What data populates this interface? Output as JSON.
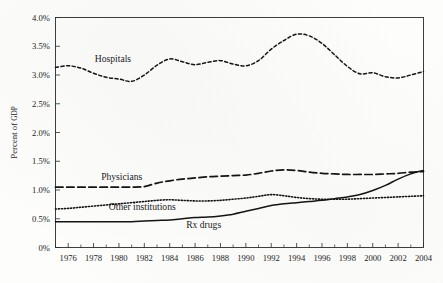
{
  "chart_data": {
    "type": "line",
    "title": "",
    "xlabel": "",
    "ylabel": "Percent of GDP",
    "ylabel_main": "Percent of ",
    "ylabel_smallcaps": "GDP",
    "xlim": [
      1975,
      2004
    ],
    "ylim": [
      0,
      4.0
    ],
    "grid": false,
    "legend_position": "inline-labels",
    "y_ticks": [
      0,
      0.5,
      1.0,
      1.5,
      2.0,
      2.5,
      3.0,
      3.5,
      4.0
    ],
    "y_tick_labels": [
      "0%",
      "0.5%",
      "1.0%",
      "1.5%",
      "2.0%",
      "2.5%",
      "3.0%",
      "3.5%",
      "4.0%"
    ],
    "x_ticks": [
      1976,
      1978,
      1980,
      1982,
      1984,
      1986,
      1988,
      1990,
      1992,
      1994,
      1996,
      1998,
      2000,
      2002,
      2004
    ],
    "x_tick_labels": [
      "1976",
      "1978",
      "1980",
      "1982",
      "1984",
      "1986",
      "1988",
      "1990",
      "1992",
      "1994",
      "1996",
      "1998",
      "2000",
      "2002",
      "2004"
    ],
    "x_minor_ticks_every": 1,
    "x": [
      1975,
      1976,
      1977,
      1978,
      1979,
      1980,
      1981,
      1982,
      1983,
      1984,
      1985,
      1986,
      1987,
      1988,
      1989,
      1990,
      1991,
      1992,
      1993,
      1994,
      1995,
      1996,
      1997,
      1998,
      1999,
      2000,
      2001,
      2002,
      2003,
      2004
    ],
    "series": [
      {
        "name": "Hospitals",
        "style": "fine-dashed",
        "label_x": 1978.1,
        "label_y": 3.23,
        "values": [
          3.13,
          3.16,
          3.12,
          3.03,
          2.96,
          2.93,
          2.89,
          3.0,
          3.17,
          3.28,
          3.23,
          3.18,
          3.22,
          3.25,
          3.19,
          3.16,
          3.25,
          3.45,
          3.6,
          3.71,
          3.68,
          3.55,
          3.35,
          3.15,
          3.02,
          3.04,
          2.97,
          2.95,
          3.0,
          3.06
        ]
      },
      {
        "name": "Physicians",
        "style": "long-dashed",
        "label_x": 1978.6,
        "label_y": 1.18,
        "values": [
          1.05,
          1.05,
          1.05,
          1.05,
          1.05,
          1.05,
          1.05,
          1.06,
          1.12,
          1.16,
          1.19,
          1.21,
          1.23,
          1.24,
          1.25,
          1.26,
          1.29,
          1.33,
          1.35,
          1.34,
          1.31,
          1.29,
          1.28,
          1.27,
          1.27,
          1.27,
          1.28,
          1.29,
          1.31,
          1.32
        ]
      },
      {
        "name": "Other institutions",
        "style": "dotted",
        "label_x": 1979.2,
        "label_y": 0.645,
        "values": [
          0.67,
          0.68,
          0.7,
          0.72,
          0.74,
          0.76,
          0.78,
          0.8,
          0.82,
          0.83,
          0.82,
          0.81,
          0.81,
          0.82,
          0.84,
          0.86,
          0.89,
          0.92,
          0.9,
          0.87,
          0.85,
          0.84,
          0.84,
          0.84,
          0.85,
          0.86,
          0.87,
          0.88,
          0.89,
          0.9
        ]
      },
      {
        "name": "Rx drugs",
        "style": "solid",
        "label_x": 1985.3,
        "label_y": 0.345,
        "values": [
          0.45,
          0.45,
          0.45,
          0.45,
          0.45,
          0.45,
          0.45,
          0.46,
          0.47,
          0.48,
          0.5,
          0.52,
          0.53,
          0.55,
          0.58,
          0.63,
          0.68,
          0.73,
          0.76,
          0.78,
          0.8,
          0.82,
          0.85,
          0.88,
          0.92,
          0.99,
          1.08,
          1.19,
          1.28,
          1.34
        ]
      }
    ]
  },
  "colors": {
    "ink": "#141414",
    "axis": "#2b2b2b",
    "paper": "#fdfdfc"
  }
}
